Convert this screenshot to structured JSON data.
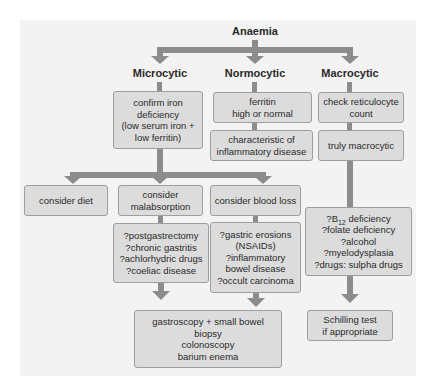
{
  "root": "Anaemia",
  "categories": {
    "microcytic": "Microcytic",
    "normocytic": "Normocytic",
    "macrocytic": "Macrocytic"
  },
  "boxes": {
    "confirm_iron": [
      "confirm iron",
      "deficiency",
      "(low serum iron +",
      "low ferritin)"
    ],
    "ferritin": [
      "ferritin",
      "high or normal"
    ],
    "characteristic": [
      "characteristic of",
      "inflammatory disease"
    ],
    "check_retic": [
      "check reticulocyte",
      "count"
    ],
    "truly_macro": [
      "truly macrocytic"
    ],
    "consider_diet": [
      "consider diet"
    ],
    "consider_malabsorption": [
      "consider",
      "malabsorption"
    ],
    "consider_blood_loss": [
      "consider blood loss"
    ],
    "malabsorption_causes": [
      "?postgastrectomy",
      "?chronic gastritis",
      "?achlorhydric drugs",
      "?coeliac disease"
    ],
    "blood_loss_causes": [
      "?gastric erosions",
      "(NSAIDs)",
      "?inflammatory",
      "bowel disease",
      "?occult carcinoma"
    ],
    "macro_causes": {
      "b12_prefix": "?B",
      "b12_sub": "12",
      "b12_suffix": " deficiency",
      "rest": [
        "?folate deficiency",
        "?alcohol",
        "?myelodysplasia",
        "?drugs: sulpha drugs"
      ]
    },
    "investigations": [
      "gastroscopy + small bowel",
      "biopsy",
      "colonoscopy",
      "barium enema"
    ],
    "schilling": [
      "Schilling test",
      "if appropriate"
    ]
  },
  "colors": {
    "panel": "#f3f3f3",
    "box_fill": "#dcdcdc",
    "box_border": "#9e9e9e",
    "connector": "#8c8c8c"
  }
}
